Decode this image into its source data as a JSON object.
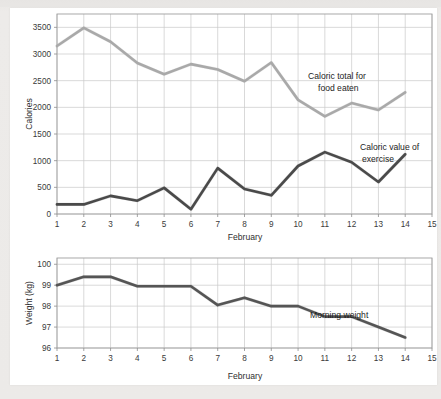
{
  "chart_data": [
    {
      "type": "line",
      "id": "calories-chart",
      "title": "",
      "xlabel": "February",
      "ylabel": "Calories",
      "xlim": [
        1,
        15
      ],
      "ylim": [
        0,
        3750
      ],
      "yticks": [
        0,
        500,
        1000,
        1500,
        2000,
        2500,
        3000,
        3500
      ],
      "xticks": [
        1,
        2,
        3,
        4,
        5,
        6,
        7,
        8,
        9,
        10,
        11,
        12,
        13,
        14,
        15
      ],
      "grid": true,
      "legend_position": "inline-annotation",
      "x": [
        1,
        2,
        3,
        4,
        5,
        6,
        7,
        8,
        9,
        10,
        11,
        12,
        13,
        14
      ],
      "series": [
        {
          "name": "Caloric total for food eaten",
          "annotation": "Caloric total for\nfood eaten",
          "annotation_line1": "Caloric total for",
          "annotation_line2": "food eaten",
          "color": "#a9a9a9",
          "values": [
            3150,
            3490,
            3230,
            2830,
            2620,
            2810,
            2710,
            2490,
            2840,
            2140,
            1830,
            2080,
            1950,
            2280
          ]
        },
        {
          "name": "Caloric value of exercise",
          "annotation": "Caloric value of\nexercise",
          "annotation_line1": "Caloric value of",
          "annotation_line2": "exercise",
          "color": "#4a4a4a",
          "values": [
            180,
            180,
            340,
            250,
            490,
            90,
            860,
            470,
            350,
            900,
            1160,
            970,
            600,
            1120
          ]
        }
      ]
    },
    {
      "type": "line",
      "id": "weight-chart",
      "title": "",
      "xlabel": "February",
      "ylabel": "Weight (kg)",
      "xlim": [
        1,
        15
      ],
      "ylim": [
        96,
        100.3
      ],
      "yticks": [
        96,
        97,
        98,
        99,
        100
      ],
      "xticks": [
        1,
        2,
        3,
        4,
        5,
        6,
        7,
        8,
        9,
        10,
        11,
        12,
        13,
        14,
        15
      ],
      "grid": true,
      "legend_position": "inline-annotation",
      "x": [
        1,
        2,
        3,
        4,
        5,
        6,
        7,
        8,
        9,
        10,
        11,
        12,
        13,
        14
      ],
      "series": [
        {
          "name": "Morning weight",
          "annotation": "Morning weight",
          "annotation_line1": "Morning weight",
          "annotation_line2": "",
          "color": "#555555",
          "values": [
            99.0,
            99.4,
            99.4,
            98.95,
            98.95,
            98.95,
            98.05,
            98.4,
            98.0,
            98.0,
            97.5,
            97.5,
            97.0,
            96.5
          ]
        }
      ]
    }
  ],
  "axes": {
    "calories": {
      "ylabel": "Calories",
      "xlabel": "February",
      "ytick_labels": [
        "3500",
        "3000",
        "2500",
        "2000",
        "1500",
        "1000",
        "500",
        "0"
      ],
      "xtick_labels": [
        "1",
        "2",
        "3",
        "4",
        "5",
        "6",
        "7",
        "8",
        "9",
        "10",
        "11",
        "12",
        "13",
        "14",
        "15"
      ]
    },
    "weight": {
      "ylabel": "Weight (kg)",
      "xlabel": "February",
      "ytick_labels": [
        "100",
        "99",
        "98",
        "97",
        "96"
      ],
      "xtick_labels": [
        "1",
        "2",
        "3",
        "4",
        "5",
        "6",
        "7",
        "8",
        "9",
        "10",
        "11",
        "12",
        "13",
        "14",
        "15"
      ]
    }
  },
  "annotations": {
    "food_line1": "Caloric total for",
    "food_line2": "food eaten",
    "exercise_line1": "Caloric value of",
    "exercise_line2": "exercise",
    "weight_label": "Morning weight"
  },
  "colors": {
    "food_line": "#a9a9a9",
    "exercise_line": "#4a4a4a",
    "weight_line": "#555555",
    "grid": "#c9c9c9",
    "border": "#9f9f9f",
    "page_background": "#eceae8",
    "card_background": "#ffffff"
  }
}
